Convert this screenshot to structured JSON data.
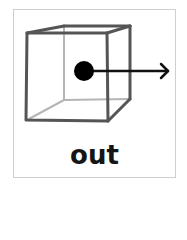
{
  "card": {
    "label": "out",
    "border_color": "#cfcfcf"
  },
  "diagram": {
    "cube_edge_color": "#555555",
    "hidden_edge_color": "#b5b5b5",
    "dot_color": "#000000",
    "arrow_color": "#111111",
    "arrow_direction": "right",
    "meaning": "point moving out of the cube"
  }
}
